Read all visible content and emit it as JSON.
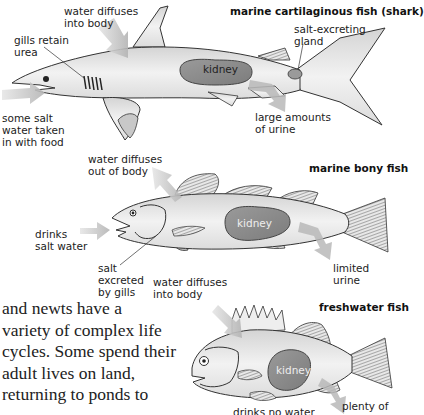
{
  "figure": {
    "kidney_label": "kidney",
    "colors": {
      "body_fill": "#e6e6e6",
      "kidney_fill": "#8c8c8c",
      "arrow_fill": "#bdbdbd",
      "outline": "#333333"
    },
    "shark": {
      "title": "marine cartilaginous fish (shark)",
      "labels": {
        "water_in": "water diffuses\ninto body",
        "gills": "gills retain\nurea",
        "salt_gland": "salt-excreting\ngland",
        "salt_water": "some salt\nwater taken\nin with food",
        "urine": "large amounts\nof urine"
      }
    },
    "bony": {
      "title": "marine bony fish",
      "labels": {
        "water_out": "water diffuses\nout of body",
        "drinks": "drinks\nsalt water",
        "salt_gills": "salt\nexcreted\nby gills",
        "urine": "limited\nurine"
      }
    },
    "freshwater": {
      "title": "freshwater fish",
      "labels": {
        "water_in": "water diffuses\ninto body",
        "drinks": "drinks no water",
        "urine": "plenty of"
      }
    }
  },
  "body_text": {
    "lines": [
      "and newts have a",
      "variety of complex life",
      "cycles. Some spend their",
      "adult lives on land,",
      "returning to ponds to"
    ]
  }
}
